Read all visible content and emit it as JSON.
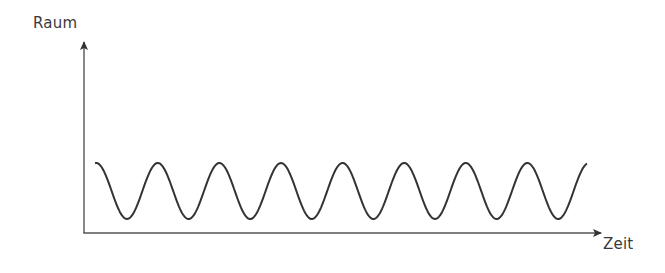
{
  "diagram": {
    "y_axis_label": "Raum",
    "x_axis_label": "Zeit",
    "line_color": "#333333",
    "axis_color": "#444444"
  },
  "chart_data": {
    "type": "line",
    "title": "",
    "xlabel": "Zeit",
    "ylabel": "Raum",
    "wave": {
      "start_x_px": 95,
      "end_x_px": 587,
      "peak_y_px": 163,
      "trough_y_px": 219,
      "period_px": 61.6,
      "peaks": 7,
      "troughs": 8
    },
    "grid": false,
    "legend": null
  }
}
